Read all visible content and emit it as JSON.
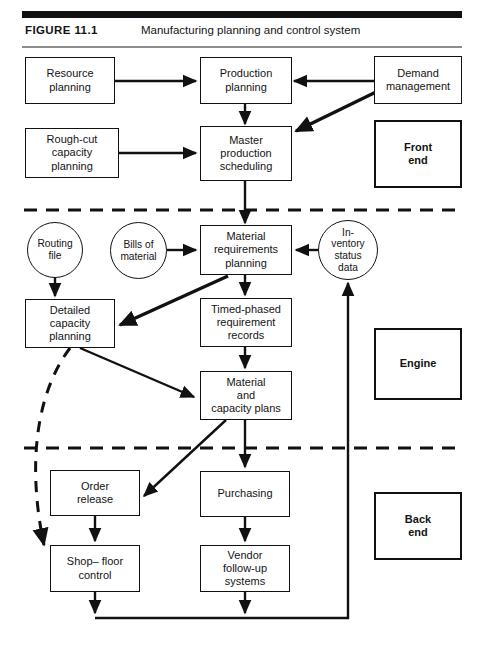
{
  "figure": {
    "label": "FIGURE  11.1",
    "caption": "Manufacturing planning and control system"
  },
  "colors": {
    "line": "#111111",
    "background": "#ffffff",
    "rule": "#111111",
    "thin_rule": "#8d8d8d"
  },
  "diagram": {
    "type": "flowchart",
    "sections": [
      {
        "id": "front-end",
        "legend_label": "Front\nend",
        "legend_line1": "Front",
        "legend_line2": "end"
      },
      {
        "id": "engine",
        "legend_label": "Engine",
        "legend_line1": "Engine",
        "legend_line2": ""
      },
      {
        "id": "back-end",
        "legend_label": "Back\nend",
        "legend_line1": "Back",
        "legend_line2": "end"
      }
    ],
    "nodes": [
      {
        "id": "resource-planning",
        "shape": "rect",
        "line1": "Resource",
        "line2": "planning",
        "line3": ""
      },
      {
        "id": "production-planning",
        "shape": "rect",
        "line1": "Production",
        "line2": "planning",
        "line3": ""
      },
      {
        "id": "demand-management",
        "shape": "rect",
        "line1": "Demand",
        "line2": "management",
        "line3": ""
      },
      {
        "id": "rough-cut-capacity",
        "shape": "rect",
        "line1": "Rough-cut",
        "line2": "capacity",
        "line3": "planning"
      },
      {
        "id": "master-production-sched",
        "shape": "rect",
        "line1": "Master",
        "line2": "production",
        "line3": "scheduling"
      },
      {
        "id": "routing-file",
        "shape": "circle",
        "line1": "Routing",
        "line2": "file",
        "line3": ""
      },
      {
        "id": "bills-of-material",
        "shape": "circle",
        "line1": "Bills of",
        "line2": "material",
        "line3": ""
      },
      {
        "id": "material-requirements",
        "shape": "rect",
        "line1": "Material",
        "line2": "requirements",
        "line3": "planning"
      },
      {
        "id": "inventory-status-data",
        "shape": "circle",
        "line1": "In-",
        "line2": "ventory",
        "line3": "status",
        "line4": "data"
      },
      {
        "id": "detailed-capacity",
        "shape": "rect",
        "line1": "Detailed",
        "line2": "capacity",
        "line3": "planning"
      },
      {
        "id": "timed-phased-records",
        "shape": "rect",
        "line1": "Timed-phased",
        "line2": "requirement",
        "line3": "records"
      },
      {
        "id": "material-capacity-plans",
        "shape": "rect",
        "line1": "Material",
        "line2": "and",
        "line3": "capacity plans"
      },
      {
        "id": "order-release",
        "shape": "rect",
        "line1": "Order",
        "line2": "release",
        "line3": ""
      },
      {
        "id": "purchasing",
        "shape": "rect",
        "line1": "Purchasing",
        "line2": "",
        "line3": ""
      },
      {
        "id": "shop-floor-control",
        "shape": "rect",
        "line1": "Shop– floor",
        "line2": "control",
        "line3": ""
      },
      {
        "id": "vendor-follow-up",
        "shape": "rect",
        "line1": "Vendor",
        "line2": "follow-up",
        "line3": "systems"
      }
    ],
    "edges": [
      {
        "from": "resource-planning",
        "to": "production-planning",
        "style": "solid"
      },
      {
        "from": "demand-management",
        "to": "production-planning",
        "style": "solid"
      },
      {
        "from": "demand-management",
        "to": "master-production-sched",
        "style": "solid-bold"
      },
      {
        "from": "production-planning",
        "to": "master-production-sched",
        "style": "solid"
      },
      {
        "from": "rough-cut-capacity",
        "to": "master-production-sched",
        "style": "solid-bidirectional"
      },
      {
        "from": "master-production-sched",
        "to": "material-requirements",
        "style": "solid"
      },
      {
        "from": "bills-of-material",
        "to": "material-requirements",
        "style": "solid"
      },
      {
        "from": "inventory-status-data",
        "to": "material-requirements",
        "style": "solid"
      },
      {
        "from": "routing-file",
        "to": "detailed-capacity",
        "style": "solid"
      },
      {
        "from": "material-requirements",
        "to": "detailed-capacity",
        "style": "solid"
      },
      {
        "from": "material-requirements",
        "to": "timed-phased-records",
        "style": "solid"
      },
      {
        "from": "timed-phased-records",
        "to": "material-capacity-plans",
        "style": "solid"
      },
      {
        "from": "detailed-capacity",
        "to": "material-capacity-plans",
        "style": "solid"
      },
      {
        "from": "detailed-capacity",
        "to": "shop-floor-control",
        "style": "dashed-curve"
      },
      {
        "from": "material-capacity-plans",
        "to": "order-release",
        "style": "solid"
      },
      {
        "from": "material-capacity-plans",
        "to": "purchasing",
        "style": "solid"
      },
      {
        "from": "order-release",
        "to": "shop-floor-control",
        "style": "solid"
      },
      {
        "from": "purchasing",
        "to": "vendor-follow-up",
        "style": "solid"
      },
      {
        "from": "shop-floor-control",
        "to": "inventory-status-data",
        "style": "solid-feedback"
      },
      {
        "from": "vendor-follow-up",
        "to": "inventory-status-data",
        "style": "solid-feedback"
      }
    ],
    "dividers": [
      {
        "id": "front-end-engine-divider",
        "style": "dashed"
      },
      {
        "id": "engine-back-end-divider",
        "style": "dashed"
      }
    ]
  }
}
